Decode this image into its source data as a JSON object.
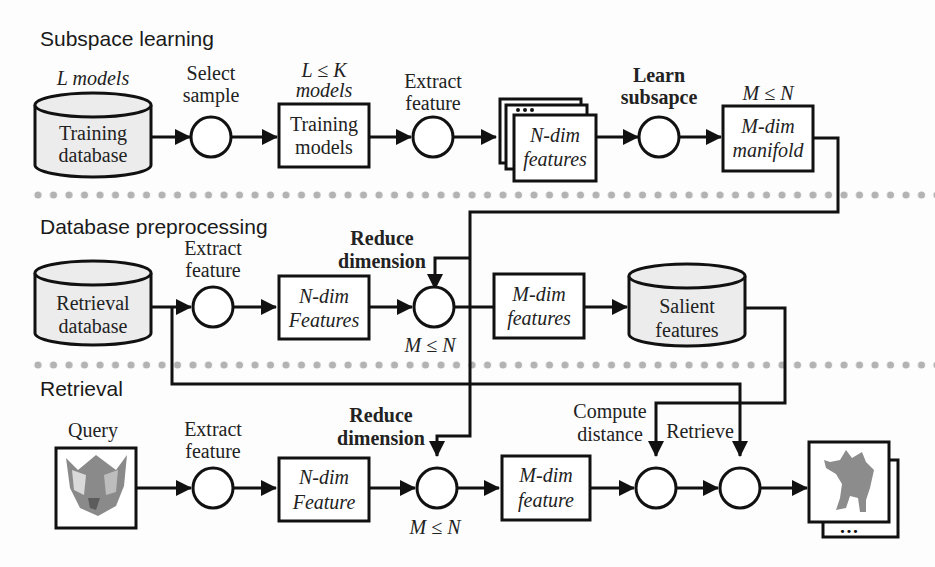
{
  "sections": [
    {
      "title": "Subspace learning"
    },
    {
      "title": "Database preprocessing"
    },
    {
      "title": "Retrieval"
    }
  ],
  "subspace": {
    "training_db": {
      "top": "L models",
      "line1": "Training",
      "line2": "database"
    },
    "select_sample": {
      "line1": "Select",
      "line2": "sample"
    },
    "training_models": {
      "top1": "L ≤ K",
      "top2": "models",
      "line1": "Training",
      "line2": "models"
    },
    "extract": {
      "line1": "Extract",
      "line2": "feature"
    },
    "ndim": {
      "line1": "N-dim",
      "line2": "features"
    },
    "learn": {
      "line1": "Learn",
      "line2": "subsapce"
    },
    "manifold": {
      "top": "M ≤ N",
      "line1": "M-dim",
      "line2": "manifold"
    }
  },
  "preprocess": {
    "retrieval_db": {
      "line1": "Retrieval",
      "line2": "database"
    },
    "extract": {
      "line1": "Extract",
      "line2": "feature"
    },
    "ndim": {
      "line1": "N-dim",
      "line2": "Features"
    },
    "reduce": {
      "line1": "Reduce",
      "line2": "dimension",
      "bottom": "M ≤ N"
    },
    "mdim": {
      "line1": "M-dim",
      "line2": "features"
    },
    "salient": {
      "line1": "Salient",
      "line2": "features"
    }
  },
  "retrieval": {
    "query": {
      "label": "Query"
    },
    "extract": {
      "line1": "Extract",
      "line2": "feature"
    },
    "ndim": {
      "line1": "N-dim",
      "line2": "Feature"
    },
    "reduce": {
      "line1": "Reduce",
      "line2": "dimension",
      "bottom": "M ≤ N"
    },
    "mdim": {
      "line1": "M-dim",
      "line2": "feature"
    },
    "compute": {
      "line1": "Compute",
      "line2": "distance"
    },
    "retrieve": {
      "label": "Retrieve"
    },
    "results": {
      "ellipsis": "•••"
    }
  },
  "colors": {
    "line": "#111111",
    "divider": "#b3b3b3",
    "cylinder": "#ececec"
  }
}
